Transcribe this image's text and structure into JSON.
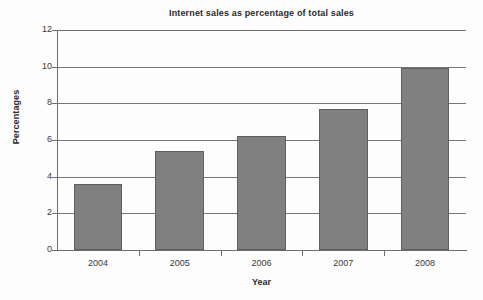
{
  "chart_data": {
    "type": "bar",
    "title": "Internet sales as percentage of total sales",
    "xlabel": "Year",
    "ylabel": "Percentages",
    "categories": [
      "2004",
      "2005",
      "2006",
      "2007",
      "2008"
    ],
    "values": [
      3.6,
      5.4,
      6.2,
      7.7,
      9.95
    ],
    "series": [
      {
        "name": "Internet sales as percentage of total sales",
        "values": [
          3.6,
          5.4,
          6.2,
          7.7,
          9.95
        ]
      }
    ],
    "ylim": [
      0,
      12
    ],
    "yticks": [
      0,
      2,
      4,
      6,
      8,
      10,
      12
    ],
    "ytick_labels": [
      "0",
      "2",
      "4",
      "6",
      "8",
      "10",
      "12"
    ],
    "grid": true,
    "grid_axis": "y",
    "legend": false,
    "legend_position": "none",
    "bar_color": "#808080",
    "bar_edge_color": "#5f5f5f",
    "grid_color": "#777777",
    "axis_color": "#6e6e6e",
    "text_color": "#2b2b2b",
    "background_color": "#ffffff"
  }
}
